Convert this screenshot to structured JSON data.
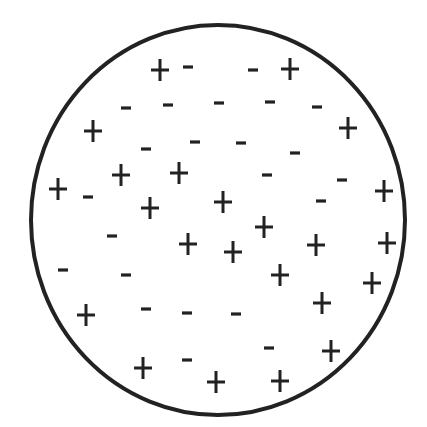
{
  "diagram": {
    "colors": {
      "background": "#ffffff",
      "ink": "#222222"
    },
    "circle": {
      "cx": 218,
      "cy": 220,
      "rx": 187,
      "ry": 195,
      "stroke_width": 4
    },
    "charges": [
      {
        "sign": "+",
        "x": 160,
        "y": 70
      },
      {
        "sign": "-",
        "x": 188,
        "y": 67
      },
      {
        "sign": "-",
        "x": 253,
        "y": 70
      },
      {
        "sign": "+",
        "x": 290,
        "y": 69
      },
      {
        "sign": "-",
        "x": 126,
        "y": 108
      },
      {
        "sign": "-",
        "x": 168,
        "y": 105
      },
      {
        "sign": "-",
        "x": 219,
        "y": 103
      },
      {
        "sign": "-",
        "x": 270,
        "y": 102
      },
      {
        "sign": "-",
        "x": 317,
        "y": 107
      },
      {
        "sign": "+",
        "x": 93,
        "y": 131
      },
      {
        "sign": "+",
        "x": 348,
        "y": 128
      },
      {
        "sign": "-",
        "x": 146,
        "y": 149
      },
      {
        "sign": "-",
        "x": 195,
        "y": 142
      },
      {
        "sign": "-",
        "x": 241,
        "y": 143
      },
      {
        "sign": "-",
        "x": 295,
        "y": 153
      },
      {
        "sign": "+",
        "x": 121,
        "y": 175
      },
      {
        "sign": "+",
        "x": 179,
        "y": 173
      },
      {
        "sign": "-",
        "x": 267,
        "y": 175
      },
      {
        "sign": "-",
        "x": 342,
        "y": 180
      },
      {
        "sign": "+",
        "x": 58,
        "y": 189
      },
      {
        "sign": "-",
        "x": 88,
        "y": 197
      },
      {
        "sign": "+",
        "x": 384,
        "y": 191
      },
      {
        "sign": "+",
        "x": 150,
        "y": 208
      },
      {
        "sign": "+",
        "x": 223,
        "y": 202
      },
      {
        "sign": "-",
        "x": 321,
        "y": 201
      },
      {
        "sign": "+",
        "x": 264,
        "y": 227
      },
      {
        "sign": "-",
        "x": 112,
        "y": 236
      },
      {
        "sign": "+",
        "x": 188,
        "y": 244
      },
      {
        "sign": "+",
        "x": 233,
        "y": 252
      },
      {
        "sign": "+",
        "x": 316,
        "y": 245
      },
      {
        "sign": "+",
        "x": 387,
        "y": 243
      },
      {
        "sign": "-",
        "x": 63,
        "y": 270
      },
      {
        "sign": "-",
        "x": 126,
        "y": 275
      },
      {
        "sign": "+",
        "x": 280,
        "y": 275
      },
      {
        "sign": "+",
        "x": 372,
        "y": 283
      },
      {
        "sign": "+",
        "x": 86,
        "y": 315
      },
      {
        "sign": "-",
        "x": 146,
        "y": 309
      },
      {
        "sign": "-",
        "x": 187,
        "y": 313
      },
      {
        "sign": "-",
        "x": 236,
        "y": 314
      },
      {
        "sign": "+",
        "x": 322,
        "y": 303
      },
      {
        "sign": "-",
        "x": 269,
        "y": 348
      },
      {
        "sign": "+",
        "x": 331,
        "y": 351
      },
      {
        "sign": "+",
        "x": 143,
        "y": 368
      },
      {
        "sign": "-",
        "x": 187,
        "y": 360
      },
      {
        "sign": "+",
        "x": 216,
        "y": 382
      },
      {
        "sign": "+",
        "x": 280,
        "y": 381
      }
    ],
    "counts": {
      "positive": 24,
      "negative": 22
    }
  }
}
